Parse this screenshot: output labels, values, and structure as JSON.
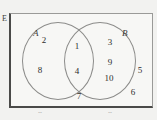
{
  "diagram": {
    "type": "venn",
    "universe_label": "E",
    "sets": [
      {
        "id": "A",
        "label": "A",
        "side": "left"
      },
      {
        "id": "B",
        "label": "B",
        "side": "right"
      }
    ],
    "regions": {
      "a_only": {
        "name": "A only",
        "members": [
          "2",
          "8"
        ]
      },
      "intersection": {
        "name": "A and B",
        "members": [
          "1",
          "4"
        ]
      },
      "b_only": {
        "name": "B only",
        "members": [
          "3",
          "9",
          "10"
        ]
      },
      "outside": {
        "name": "Neither A nor B",
        "members": [
          "7",
          "5",
          "6"
        ]
      }
    },
    "elements": [
      {
        "value": "2",
        "region": "a_only",
        "x": 44,
        "y": 41
      },
      {
        "value": "8",
        "region": "a_only",
        "x": 40,
        "y": 71
      },
      {
        "value": "1",
        "region": "intersection",
        "x": 77,
        "y": 47
      },
      {
        "value": "4",
        "region": "intersection",
        "x": 77,
        "y": 72
      },
      {
        "value": "3",
        "region": "b_only",
        "x": 110,
        "y": 43
      },
      {
        "value": "9",
        "region": "b_only",
        "x": 110,
        "y": 63
      },
      {
        "value": "10",
        "region": "b_only",
        "x": 109,
        "y": 79
      },
      {
        "value": "7",
        "region": "outside",
        "x": 79,
        "y": 97
      },
      {
        "value": "5",
        "region": "outside",
        "x": 140,
        "y": 71
      },
      {
        "value": "6",
        "region": "outside",
        "x": 133,
        "y": 93
      }
    ],
    "clipped_text": [
      {
        "glyph": "a",
        "x": 29
      },
      {
        "glyph": "a",
        "x": 99
      }
    ],
    "colors": {
      "background": "#f2f2f0",
      "universe_fill": "#f7f7f5",
      "frame_thick": "#4a4a48",
      "frame_thin": "#9a9a98",
      "circle_stroke": "#8c8c8a",
      "text": "#2e2e2c"
    }
  }
}
